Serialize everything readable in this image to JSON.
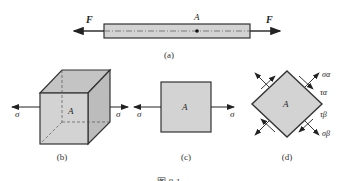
{
  "figure": {
    "caption": "图 8-1",
    "colors": {
      "fill": "#d3d3d3",
      "stroke": "#333333",
      "background": "#ffffff"
    }
  },
  "panel_a": {
    "label": "(a)",
    "force_left": "F",
    "force_right": "F",
    "point": "A"
  },
  "panel_b": {
    "label": "(b)",
    "point": "A",
    "stress_left": "σ",
    "stress_right": "σ"
  },
  "panel_c": {
    "label": "(c)",
    "point": "A",
    "stress_left": "σ",
    "stress_right": "σ"
  },
  "panel_d": {
    "label": "(d)",
    "point": "A",
    "sigma_alpha": "σα",
    "tau_alpha": "τα",
    "tau_beta": "τβ",
    "sigma_beta": "σβ"
  }
}
